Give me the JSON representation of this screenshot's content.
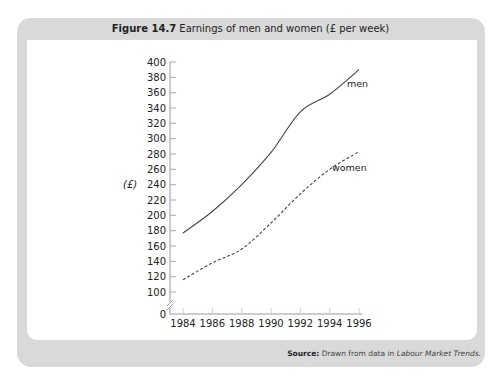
{
  "figure": {
    "number": "Figure 14.7",
    "caption": "Earnings of men and women (£ per week)",
    "source_label": "Source:",
    "source_text": "Drawn from data in",
    "source_publication": "Labour Market Trends."
  },
  "chart_data": {
    "type": "line",
    "title": "Earnings of men and women (£ per week)",
    "xlabel": "",
    "ylabel": "(£)",
    "x": [
      1984,
      1986,
      1988,
      1990,
      1992,
      1994,
      1996
    ],
    "series": [
      {
        "name": "men",
        "style": "solid",
        "values": [
          177,
          205,
          240,
          282,
          335,
          358,
          390
        ]
      },
      {
        "name": "women",
        "style": "dashed",
        "values": [
          116,
          138,
          156,
          190,
          228,
          260,
          283
        ]
      }
    ],
    "yticks": [
      0,
      100,
      120,
      140,
      160,
      180,
      200,
      220,
      240,
      260,
      280,
      300,
      320,
      340,
      360,
      380,
      400
    ],
    "xticks": [
      "1984",
      "1986",
      "1988",
      "1990",
      "1992",
      "1994",
      "1996"
    ],
    "ylim": [
      0,
      400
    ],
    "axis_break": true,
    "grid": false,
    "legend": "inline labels at line ends"
  }
}
